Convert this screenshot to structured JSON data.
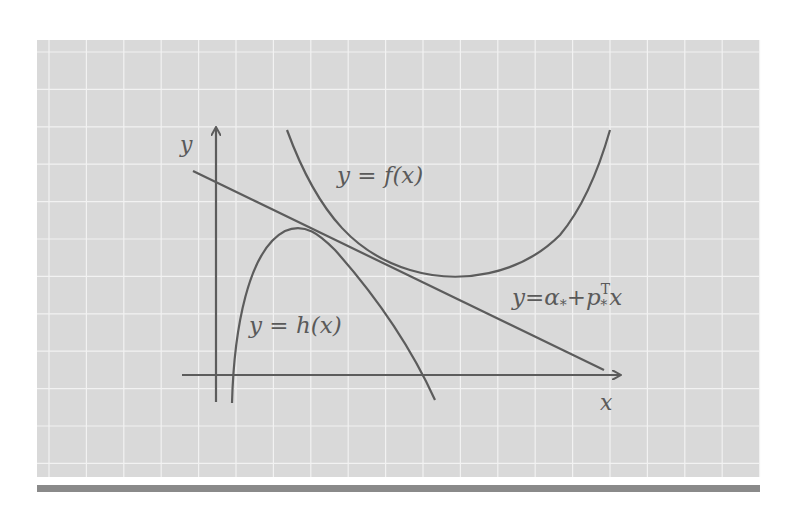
{
  "figure": {
    "colors": {
      "panel_background": "#d9d9d9",
      "grid": "#f2f2f2",
      "curves": "#5c5c5c",
      "bottom_bar": "#8a8a8a",
      "text": "#5a5a5a"
    },
    "axes": {
      "x_label": "x",
      "y_label": "y"
    },
    "curves": [
      {
        "id": "f",
        "label": "y = f(x)",
        "shape": "convex U-shaped curve above the tangent line"
      },
      {
        "id": "h",
        "label": "y = h(x)",
        "shape": "concave hump below the tangent line"
      },
      {
        "id": "tangent",
        "label_parts": {
          "lhs": "y",
          "eq": "=",
          "alpha": "α",
          "sub": "*",
          "plus": "+",
          "p": "p",
          "sup": "T",
          "x": "x"
        },
        "shape": "straight line touching both curves"
      }
    ]
  }
}
